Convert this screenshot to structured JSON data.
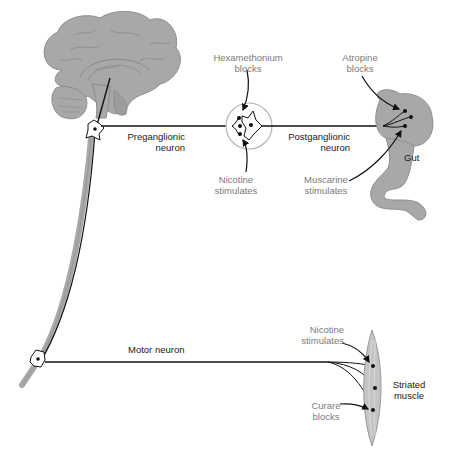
{
  "diagram": {
    "colors": {
      "tissue_fill": "#a8a8a8",
      "tissue_stroke": "#8c8c8c",
      "neuron_line": "#111111",
      "drug_label": "#7a7a7a",
      "structure_label": "#1a1a1a",
      "ganglion_ring": "#b5b5b5"
    },
    "structures": {
      "brain": "brain-sagittal",
      "spinal_cord": "spinal-cord",
      "ganglion": "autonomic-ganglion",
      "gut": "gut",
      "muscle": "striated-muscle"
    },
    "labels": {
      "preganglionic_1": "Preganglionic",
      "preganglionic_2": "neuron",
      "postganglionic_1": "Postganglionic",
      "postganglionic_2": "neuron",
      "hexamethonium_1": "Hexamethonium",
      "hexamethonium_2": "blocks",
      "nicotine_gang_1": "Nicotine",
      "nicotine_gang_2": "stimulates",
      "atropine_1": "Atropine",
      "atropine_2": "blocks",
      "muscarine_1": "Muscarine",
      "muscarine_2": "stimulates",
      "gut": "Gut",
      "motor_neuron": "Motor neuron",
      "nicotine_musc_1": "Nicotine",
      "nicotine_musc_2": "stimulates",
      "curare_1": "Curare",
      "curare_2": "blocks",
      "striated_1": "Striated",
      "striated_2": "muscle"
    }
  }
}
